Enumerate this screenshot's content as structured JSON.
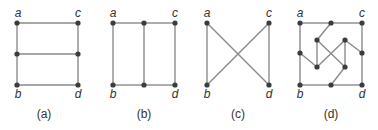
{
  "figure": {
    "colors": {
      "edge": "#8a8a8a",
      "node": "#3c3c3c",
      "text": "#333333",
      "background": "#ffffff"
    },
    "graphs": [
      {
        "id": "a",
        "caption": "(a)",
        "caption_pos": [
          44,
          118
        ],
        "labels": [
          {
            "text": "a",
            "x": 18,
            "y": 17
          },
          {
            "text": "c",
            "x": 78,
            "y": 17
          },
          {
            "text": "b",
            "x": 18,
            "y": 98
          },
          {
            "text": "d",
            "x": 78,
            "y": 98
          }
        ],
        "nodes": [
          [
            17,
            23
          ],
          [
            78,
            23
          ],
          [
            17,
            54
          ],
          [
            78,
            54
          ],
          [
            17,
            85
          ],
          [
            78,
            85
          ]
        ],
        "edges": [
          [
            0,
            1
          ],
          [
            2,
            3
          ],
          [
            4,
            5
          ],
          [
            0,
            2
          ],
          [
            2,
            4
          ],
          [
            1,
            3
          ],
          [
            3,
            5
          ]
        ]
      },
      {
        "id": "b",
        "caption": "(b)",
        "caption_pos": [
          144,
          118
        ],
        "labels": [
          {
            "text": "a",
            "x": 113,
            "y": 17
          },
          {
            "text": "c",
            "x": 175,
            "y": 17
          },
          {
            "text": "b",
            "x": 113,
            "y": 98
          },
          {
            "text": "d",
            "x": 175,
            "y": 98
          }
        ],
        "nodes": [
          [
            113,
            23
          ],
          [
            144,
            23
          ],
          [
            175,
            23
          ],
          [
            113,
            85
          ],
          [
            144,
            85
          ],
          [
            175,
            85
          ]
        ],
        "edges": [
          [
            0,
            1
          ],
          [
            1,
            2
          ],
          [
            3,
            4
          ],
          [
            4,
            5
          ],
          [
            0,
            3
          ],
          [
            1,
            4
          ],
          [
            2,
            5
          ]
        ]
      },
      {
        "id": "c",
        "caption": "(c)",
        "caption_pos": [
          238,
          118
        ],
        "labels": [
          {
            "text": "a",
            "x": 207,
            "y": 17
          },
          {
            "text": "c",
            "x": 269,
            "y": 17
          },
          {
            "text": "b",
            "x": 207,
            "y": 98
          },
          {
            "text": "d",
            "x": 269,
            "y": 98
          }
        ],
        "nodes": [
          [
            207,
            23
          ],
          [
            269,
            23
          ],
          [
            207,
            85
          ],
          [
            269,
            85
          ]
        ],
        "edges": [
          [
            0,
            2
          ],
          [
            1,
            3
          ],
          [
            0,
            3
          ],
          [
            1,
            2
          ]
        ]
      },
      {
        "id": "d",
        "caption": "(d)",
        "caption_pos": [
          331,
          118
        ],
        "labels": [
          {
            "text": "a",
            "x": 300,
            "y": 17
          },
          {
            "text": "c",
            "x": 362,
            "y": 17
          },
          {
            "text": "b",
            "x": 300,
            "y": 98
          },
          {
            "text": "d",
            "x": 362,
            "y": 98
          }
        ],
        "nodes": [
          [
            300,
            23
          ],
          [
            331,
            23
          ],
          [
            362,
            23
          ],
          [
            300,
            53
          ],
          [
            362,
            53
          ],
          [
            300,
            85
          ],
          [
            331,
            85
          ],
          [
            362,
            85
          ],
          [
            317,
            40
          ],
          [
            345,
            40
          ],
          [
            317,
            67
          ],
          [
            345,
            67
          ]
        ],
        "edges": [
          [
            0,
            1
          ],
          [
            1,
            2
          ],
          [
            2,
            4
          ],
          [
            4,
            7
          ],
          [
            7,
            6
          ],
          [
            6,
            5
          ],
          [
            5,
            3
          ],
          [
            3,
            0
          ],
          [
            1,
            8
          ],
          [
            8,
            10
          ],
          [
            8,
            11
          ],
          [
            3,
            10
          ],
          [
            9,
            4
          ],
          [
            9,
            10
          ],
          [
            9,
            11
          ],
          [
            11,
            6
          ]
        ]
      }
    ]
  }
}
